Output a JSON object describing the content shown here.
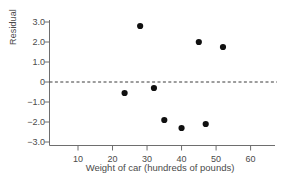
{
  "chart_data": {
    "type": "scatter",
    "title": "",
    "xlabel": "Weight of car  (hundreds of pounds)",
    "ylabel": "Residual",
    "xlim": [
      0,
      65
    ],
    "ylim": [
      -3.0,
      3.0
    ],
    "grid": false,
    "legend": null,
    "xticks": [
      10,
      20,
      30,
      40,
      50,
      60
    ],
    "xtick_labels": [
      "10",
      "20",
      "30",
      "40",
      "50",
      "60"
    ],
    "yticks": [
      3.0,
      2.0,
      1.0,
      0,
      -1.0,
      -2.0,
      -3.0
    ],
    "ytick_labels": [
      "3.0",
      "2.0",
      "1.0",
      "0",
      "−1.0",
      "−2.0",
      "−3.0"
    ],
    "reference_line": {
      "name": "zero-residual-line",
      "y": 0,
      "style": "dashed",
      "color": "#3a3a3a"
    },
    "points": [
      {
        "x": 23.5,
        "y": -0.55
      },
      {
        "x": 28.0,
        "y": 2.8
      },
      {
        "x": 32.0,
        "y": -0.3
      },
      {
        "x": 35.0,
        "y": -1.9
      },
      {
        "x": 40.0,
        "y": -2.3
      },
      {
        "x": 45.0,
        "y": 2.0
      },
      {
        "x": 47.0,
        "y": -2.1
      },
      {
        "x": 52.0,
        "y": 1.75
      }
    ],
    "marker": {
      "shape": "circle",
      "size": 3.1,
      "color": "#101010"
    },
    "colors": {
      "axis": "#6e6e6e",
      "text": "#4a4a4a",
      "marker": "#101010",
      "reference_line": "#3a3a3a",
      "background": "#ffffff"
    }
  }
}
